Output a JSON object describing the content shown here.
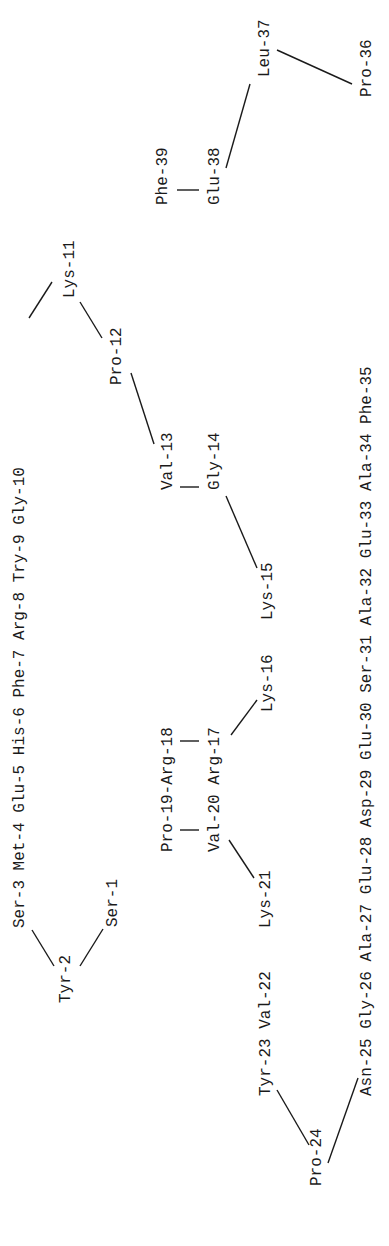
{
  "diagram": {
    "type": "peptide-sequence",
    "orientation": "rotated-90-ccw",
    "residues": [
      {
        "id": 1,
        "name": "Ser-1"
      },
      {
        "id": 2,
        "name": "Tyr-2"
      },
      {
        "id": 3,
        "name": "Ser-3"
      },
      {
        "id": 4,
        "name": "Met-4"
      },
      {
        "id": 5,
        "name": "Glu-5"
      },
      {
        "id": 6,
        "name": "His-6"
      },
      {
        "id": 7,
        "name": "Phe-7"
      },
      {
        "id": 8,
        "name": "Arg-8"
      },
      {
        "id": 9,
        "name": "Try-9"
      },
      {
        "id": 10,
        "name": "Gly-10"
      },
      {
        "id": 11,
        "name": "Lys-11"
      },
      {
        "id": 12,
        "name": "Pro-12"
      },
      {
        "id": 13,
        "name": "Val-13"
      },
      {
        "id": 14,
        "name": "Gly-14"
      },
      {
        "id": 15,
        "name": "Lys-15"
      },
      {
        "id": 16,
        "name": "Lys-16"
      },
      {
        "id": 17,
        "name": "Arg-17"
      },
      {
        "id": 18,
        "name": "Arg-18"
      },
      {
        "id": 19,
        "name": "Pro-19"
      },
      {
        "id": 20,
        "name": "Val-20"
      },
      {
        "id": 21,
        "name": "Lys-21"
      },
      {
        "id": 22,
        "name": "Val-22"
      },
      {
        "id": 23,
        "name": "Tyr-23"
      },
      {
        "id": 24,
        "name": "Pro-24"
      },
      {
        "id": 25,
        "name": "Asn-25"
      },
      {
        "id": 26,
        "name": "Gly-26"
      },
      {
        "id": 27,
        "name": "Ala-27"
      },
      {
        "id": 28,
        "name": "Glu-28"
      },
      {
        "id": 29,
        "name": "Asp-29"
      },
      {
        "id": 30,
        "name": "Glu-30"
      },
      {
        "id": 31,
        "name": "Ser-31"
      },
      {
        "id": 32,
        "name": "Ala-32"
      },
      {
        "id": 33,
        "name": "Glu-33"
      },
      {
        "id": 34,
        "name": "Ala-34"
      },
      {
        "id": 35,
        "name": "Phe-35"
      },
      {
        "id": 36,
        "name": "Pro-36"
      },
      {
        "id": 37,
        "name": "Leu-37"
      },
      {
        "id": 38,
        "name": "Glu-38"
      },
      {
        "id": 39,
        "name": "Phe-39"
      }
    ],
    "labels": {
      "row_3_10": "Ser-3 Met-4 Glu-5 His-6 Phe-7 Arg-8 Try-9 Gly-10",
      "tyr2": "Tyr-2",
      "ser1": "Ser-1",
      "lys11": "Lys-11",
      "pro12": "Pro-12",
      "val13": "Val-13",
      "gly14": "Gly-14",
      "lys15": "Lys-15",
      "lys16": "Lys-16",
      "pro19_arg18": "Pro-19-Arg-18",
      "val20_arg17": "Val-20 Arg-17",
      "lys21": "Lys-21",
      "row_21_23": "Tyr-23 Val-22",
      "pro24": "Pro-24",
      "row_25_35": "Asn-25 Gly-26 Ala-27 Glu-28 Asp-29 Glu-30 Ser-31 Ala-32 Glu-33 Ala-34 Phe-35",
      "pro36": "Pro-36",
      "leu37": "Leu-37",
      "glu38": "Glu-38",
      "phe39": "Phe-39"
    }
  }
}
